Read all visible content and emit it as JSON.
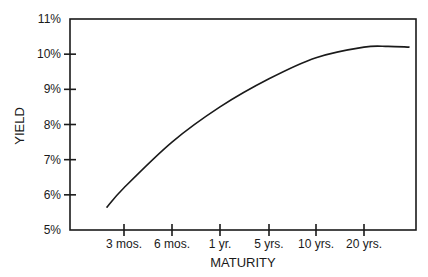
{
  "chart_data": {
    "type": "line",
    "title": "",
    "xlabel": "MATURITY",
    "ylabel": "YIELD",
    "categories": [
      "3 mos.",
      "6 mos.",
      "1 yr.",
      "5 yrs.",
      "10 yrs.",
      "20 yrs."
    ],
    "yticks": [
      "5%",
      "6%",
      "7%",
      "8%",
      "9%",
      "10%",
      "11%"
    ],
    "ylim": [
      5,
      11
    ],
    "grid": false,
    "legend": null,
    "series": [
      {
        "name": "Yield curve",
        "values": [
          6.2,
          7.5,
          8.5,
          9.3,
          9.9,
          10.2
        ]
      }
    ],
    "curve_endpoints": {
      "start_yield": 5.65,
      "end_yield": 10.2
    },
    "colors": {
      "line": "#1a1a1a",
      "axis": "#1a1a1a",
      "background": "#ffffff"
    }
  }
}
